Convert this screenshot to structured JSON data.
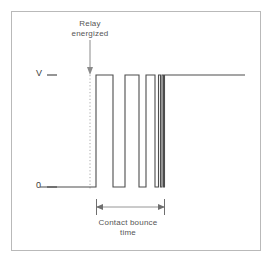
{
  "figure": {
    "name": "relay-contact-bounce-waveform",
    "background_color": "#ffffff",
    "border_color": "#b9b9b9",
    "trace_color": "#4d4d4d",
    "annotation_color": "#555555",
    "frame": {
      "x": 11,
      "y": 11,
      "width": 250,
      "height": 240
    }
  },
  "axis": {
    "high_label": "V",
    "low_label": "0",
    "high_y": 75,
    "low_y": 187,
    "tick_color": "#4d4d4d"
  },
  "annotations": {
    "relay": {
      "line1": "Relay",
      "line2": "energized",
      "pointer_x": 90,
      "pointer_top": 40,
      "pointer_bottom": 73,
      "dotted_from": 73,
      "dotted_to": 190
    },
    "bounce": {
      "line1": "Contact bounce",
      "line2": "time",
      "arrow_y": 207,
      "arrow_left": 96,
      "arrow_right": 165
    }
  },
  "chart_data": {
    "type": "line",
    "title": "",
    "xlabel": "",
    "ylabel": "",
    "y_tick_labels": [
      "V",
      "0"
    ],
    "ylim": [
      0,
      1
    ],
    "levels": {
      "low": 0,
      "high": 1
    },
    "series": [
      {
        "name": "contact voltage",
        "color": "#4d4d4d",
        "points": [
          [
            40,
            0
          ],
          [
            96,
            0
          ],
          [
            96,
            1
          ],
          [
            113,
            1
          ],
          [
            113,
            0
          ],
          [
            125,
            0
          ],
          [
            125,
            1
          ],
          [
            139,
            1
          ],
          [
            139,
            0
          ],
          [
            146,
            0
          ],
          [
            146,
            1
          ],
          [
            155,
            1
          ],
          [
            155,
            0
          ],
          [
            158.5,
            0
          ],
          [
            158.5,
            1
          ],
          [
            160.5,
            1
          ],
          [
            160.5,
            0
          ],
          [
            162,
            0
          ],
          [
            162,
            1
          ],
          [
            163.5,
            1
          ],
          [
            163.5,
            0
          ],
          [
            164.5,
            0
          ],
          [
            164.5,
            1
          ],
          [
            245,
            1
          ]
        ]
      }
    ]
  }
}
